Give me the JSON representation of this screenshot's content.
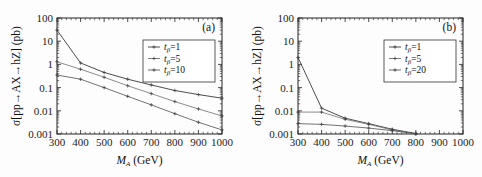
{
  "figure": {
    "background": "#fdfdfd",
    "axis_color": "#222222"
  },
  "chart_data": [
    {
      "type": "line",
      "panel_tag": "(a)",
      "title": "",
      "xlabel": "M_A (GeV)",
      "xlabel_parts": {
        "symbol": "M",
        "subscript": "A",
        "unit": "(GeV)"
      },
      "ylabel": "σ[pp→AX→hZ] (pb)",
      "ylabel_parts": {
        "symbol": "σ",
        "process": "[pp→AX→hZ]",
        "unit": "(pb)"
      },
      "xscale": "linear",
      "yscale": "log",
      "xlim": [
        300,
        1000
      ],
      "ylim": [
        0.001,
        100
      ],
      "xticks": [
        300,
        400,
        500,
        600,
        700,
        800,
        900,
        1000
      ],
      "xticklabels": [
        "300",
        "400",
        "500",
        "600",
        "700",
        "800",
        "900",
        "1000"
      ],
      "yticks": [
        0.001,
        0.01,
        0.1,
        1,
        10,
        100
      ],
      "yticklabels": [
        "0.001",
        "0.01",
        "0.1",
        "1",
        "10",
        "100"
      ],
      "grid": false,
      "legend_position": "upper right",
      "x": [
        300,
        400,
        500,
        600,
        700,
        800,
        900,
        1000
      ],
      "series": [
        {
          "name": "t_β=1",
          "label_symbol": "t",
          "label_sub": "β",
          "label_value": "=1",
          "color": "#3a3a3a",
          "values": [
            30,
            1.15,
            0.45,
            0.23,
            0.13,
            0.075,
            0.05,
            0.035
          ]
        },
        {
          "name": "t_β=5",
          "label_symbol": "t",
          "label_sub": "β",
          "label_value": "=5",
          "color": "#6f6f6f",
          "values": [
            1.3,
            0.62,
            0.28,
            0.12,
            0.055,
            0.025,
            0.012,
            0.006
          ]
        },
        {
          "name": "t_β=10",
          "label_symbol": "t",
          "label_sub": "β",
          "label_value": "=10",
          "color": "#5a5a5a",
          "values": [
            0.35,
            0.23,
            0.1,
            0.042,
            0.018,
            0.0075,
            0.0032,
            0.0015
          ]
        }
      ]
    },
    {
      "type": "line",
      "panel_tag": "(b)",
      "title": "",
      "xlabel": "M_A (GeV)",
      "xlabel_parts": {
        "symbol": "M",
        "subscript": "A",
        "unit": "(GeV)"
      },
      "ylabel": "σ[pp→AX→hZ] (pb)",
      "ylabel_parts": {
        "symbol": "σ",
        "process": "[pp→AX→hZ]",
        "unit": "(pb)"
      },
      "xscale": "linear",
      "yscale": "log",
      "xlim": [
        300,
        1000
      ],
      "ylim": [
        0.001,
        100
      ],
      "xticks": [
        300,
        400,
        500,
        600,
        700,
        800,
        900,
        1000
      ],
      "xticklabels": [
        "300",
        "400",
        "500",
        "600",
        "700",
        "800",
        "900",
        "1000"
      ],
      "yticks": [
        0.001,
        0.01,
        0.1,
        1,
        10,
        100
      ],
      "yticklabels": [
        "0.001",
        "0.01",
        "0.1",
        "1",
        "10",
        "100"
      ],
      "grid": false,
      "legend_position": "upper right",
      "x": [
        300,
        400,
        500,
        600,
        700,
        800
      ],
      "series": [
        {
          "name": "t_β=1",
          "label_symbol": "t",
          "label_sub": "β",
          "label_value": "=1",
          "color": "#3a3a3a",
          "values": [
            2.0,
            0.013,
            0.0048,
            0.0028,
            0.0016,
            0.00105
          ]
        },
        {
          "name": "t_β=5",
          "label_symbol": "t",
          "label_sub": "β",
          "label_value": "=5",
          "color": "#6f6f6f",
          "values": [
            0.0088,
            0.0088,
            0.0043,
            0.0026,
            0.0015,
            0.00103
          ]
        },
        {
          "name": "t_β=20",
          "label_symbol": "t",
          "label_sub": "β",
          "label_value": "=20",
          "color": "#5a5a5a",
          "values": [
            0.0028,
            0.0026,
            0.0022,
            0.0018,
            0.0014,
            0.00102
          ]
        }
      ]
    }
  ]
}
